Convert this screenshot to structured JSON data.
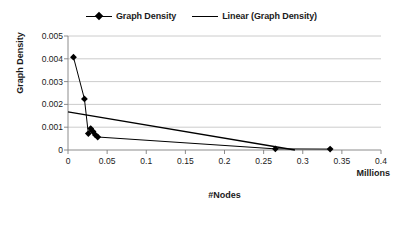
{
  "chart_data": {
    "type": "scatter",
    "title": "",
    "xlabel": "#Nodes",
    "ylabel": "Graph Density",
    "x_units_label": "Millions",
    "xlim": [
      0,
      0.4
    ],
    "ylim": [
      0,
      0.005
    ],
    "grid": "horizontal",
    "legend_position": "top-center",
    "x_ticks": [
      "0",
      "0.05",
      "0.1",
      "0.15",
      "0.2",
      "0.25",
      "0.3",
      "0.35",
      "0.4"
    ],
    "x_tick_values": [
      0,
      0.05,
      0.1,
      0.15,
      0.2,
      0.25,
      0.3,
      0.35,
      0.4
    ],
    "y_ticks": [
      "0",
      "0.001",
      "0.002",
      "0.003",
      "0.004",
      "0.005"
    ],
    "y_tick_values": [
      0,
      0.001,
      0.002,
      0.003,
      0.004,
      0.005
    ],
    "series": [
      {
        "name": "Graph Density",
        "type": "scatter-line",
        "marker": "diamond",
        "color": "#000000",
        "points": [
          {
            "x": 0.007,
            "y": 0.00407
          },
          {
            "x": 0.021,
            "y": 0.00224
          },
          {
            "x": 0.026,
            "y": 0.00072
          },
          {
            "x": 0.029,
            "y": 0.00094
          },
          {
            "x": 0.032,
            "y": 0.00081
          },
          {
            "x": 0.035,
            "y": 0.00066
          },
          {
            "x": 0.038,
            "y": 0.00057
          },
          {
            "x": 0.265,
            "y": 5e-05
          },
          {
            "x": 0.335,
            "y": 4e-05
          }
        ]
      },
      {
        "name": "Linear (Graph Density)",
        "type": "trendline",
        "color": "#000000",
        "points": [
          {
            "x": 0.0,
            "y": 0.00167
          },
          {
            "x": 0.29,
            "y": 0.0
          }
        ]
      }
    ]
  },
  "legend": {
    "entries": [
      {
        "label": "Graph Density",
        "swatch": "line-with-diamond"
      },
      {
        "label": "Linear (Graph Density)",
        "swatch": "line"
      }
    ]
  },
  "axes": {
    "x_title": "#Nodes",
    "y_title": "Graph Density",
    "units": "Millions"
  },
  "colors": {
    "series": "#000000",
    "gridline": "#bfbfbf",
    "axis": "#7f7f7f",
    "text": "#1a1a1a",
    "background": "#ffffff"
  }
}
